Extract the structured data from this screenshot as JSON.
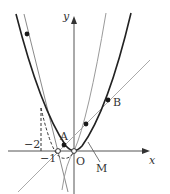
{
  "figure": {
    "type": "coordinate-graph",
    "axes": {
      "x_label": "x",
      "y_label": "y",
      "origin_label": "O"
    },
    "tick_labels": {
      "x_minus_1": "−1",
      "y_level_minus_2_marker": "−2"
    },
    "points": [
      {
        "label": "A",
        "style": "filled"
      },
      {
        "label": "B",
        "style": "filled"
      },
      {
        "label": "M",
        "style": "leader-line"
      }
    ],
    "curves": [
      {
        "name": "main-parabola",
        "stroke": "#222222",
        "weight": "bold"
      },
      {
        "name": "steep-parabola",
        "stroke": "#9a9a9a",
        "weight": "thin"
      },
      {
        "name": "secant-line-AB",
        "stroke": "#a8a8a8",
        "weight": "thin"
      },
      {
        "name": "steep-line",
        "stroke": "#8a8a8a",
        "weight": "thin"
      },
      {
        "name": "dashed-parabola-segment",
        "stroke": "#333333",
        "style": "dashed"
      }
    ],
    "colors": {
      "axis": "#555555",
      "dark_curve": "#222222",
      "light_curve": "#a0a0a0",
      "point": "#1a1a1a"
    }
  }
}
